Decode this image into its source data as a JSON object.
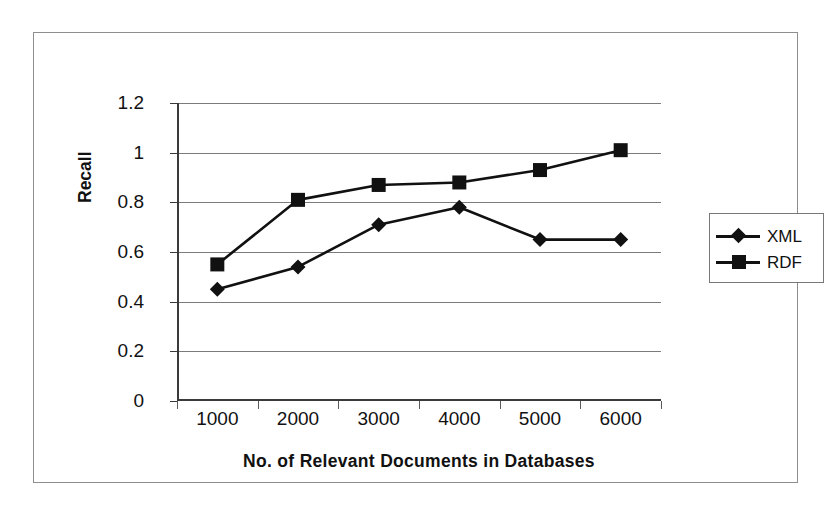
{
  "chart_data": {
    "type": "line",
    "title": "",
    "xlabel": "No. of Relevant Documents in Databases",
    "ylabel": "Recall",
    "categories": [
      "1000",
      "2000",
      "3000",
      "4000",
      "5000",
      "6000"
    ],
    "x": [
      1000,
      2000,
      3000,
      4000,
      5000,
      6000
    ],
    "series": [
      {
        "name": "XML",
        "marker": "diamond",
        "values": [
          0.45,
          0.54,
          0.71,
          0.78,
          0.65,
          0.65
        ]
      },
      {
        "name": "RDF",
        "marker": "square",
        "values": [
          0.55,
          0.81,
          0.87,
          0.88,
          0.93,
          1.01
        ]
      }
    ],
    "ylim": [
      0,
      1.2
    ],
    "yticks": [
      "0",
      "0.2",
      "0.4",
      "0.6",
      "0.8",
      "1",
      "1.2"
    ],
    "ytick_values": [
      0,
      0.2,
      0.4,
      0.6,
      0.8,
      1,
      1.2
    ],
    "grid": "horizontal",
    "legend_position": "right",
    "colors": {
      "series": "#111111",
      "grid": "#7b7b7b",
      "axis": "#3a3a3a",
      "background": "#ffffff"
    }
  },
  "axis": {
    "y_title": "Recall",
    "x_title": "No. of Relevant Documents in Databases",
    "y_labels": [
      "1.2",
      "1",
      "0.8",
      "0.6",
      "0.4",
      "0.2",
      "0"
    ],
    "x_labels": [
      "1000",
      "2000",
      "3000",
      "4000",
      "5000",
      "6000"
    ]
  },
  "legend": {
    "entries": [
      {
        "label": "XML",
        "marker": "diamond"
      },
      {
        "label": "RDF",
        "marker": "square"
      }
    ]
  }
}
